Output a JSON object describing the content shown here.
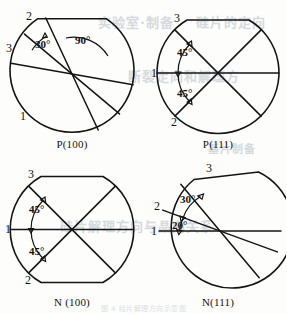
{
  "figure": {
    "stroke_color": "#141414",
    "background_color": "#fdfdfc",
    "ghost_color": "#cfd4d8"
  },
  "panels": [
    {
      "id": "p100",
      "caption": "P(100)",
      "flat": "top",
      "index_labels": [
        {
          "text": "2",
          "x": 22,
          "y": 16
        },
        {
          "text": "3",
          "x": 4,
          "y": 48
        },
        {
          "text": "1",
          "x": 18,
          "y": 115
        }
      ],
      "angle_labels": [
        {
          "text": "30°",
          "x": 33,
          "y": 43
        },
        {
          "text": "90°",
          "x": 74,
          "y": 40
        }
      ],
      "lines": [
        {
          "name": "line-1",
          "a1": 170,
          "a2": 350
        },
        {
          "name": "line-2",
          "a1": 140,
          "a2": 320
        },
        {
          "name": "line-3",
          "a1": 115,
          "a2": 295
        }
      ]
    },
    {
      "id": "p111",
      "caption": "P(111)",
      "flat": "top",
      "index_labels": [
        {
          "text": "3",
          "x": 25,
          "y": 18
        },
        {
          "text": "1",
          "x": 3,
          "y": 69
        },
        {
          "text": "2",
          "x": 22,
          "y": 120
        }
      ],
      "angle_labels": [
        {
          "text": "45°",
          "x": 30,
          "y": 48
        },
        {
          "text": "45°",
          "x": 30,
          "y": 90
        }
      ],
      "lines": [
        {
          "name": "line-1",
          "a1": 180,
          "a2": 0
        },
        {
          "name": "line-2",
          "a1": 225,
          "a2": 45
        },
        {
          "name": "line-3",
          "a1": 135,
          "a2": 315
        }
      ]
    },
    {
      "id": "n100",
      "caption": "N (100)",
      "flat": "top-bottom",
      "index_labels": [
        {
          "text": "3",
          "x": 25,
          "y": 18
        },
        {
          "text": "1",
          "x": 3,
          "y": 69
        },
        {
          "text": "2",
          "x": 22,
          "y": 120
        }
      ],
      "angle_labels": [
        {
          "text": "45°",
          "x": 28,
          "y": 48
        },
        {
          "text": "45°",
          "x": 28,
          "y": 92
        }
      ],
      "lines": [
        {
          "name": "line-1",
          "a1": 180,
          "a2": 0
        },
        {
          "name": "line-2",
          "a1": 225,
          "a2": 45
        },
        {
          "name": "line-3",
          "a1": 135,
          "a2": 315
        }
      ]
    },
    {
      "id": "n111",
      "caption": "N(111)",
      "flat": "top",
      "index_labels": [
        {
          "text": "3",
          "x": 58,
          "y": 10
        },
        {
          "text": "2",
          "x": 6,
          "y": 48
        },
        {
          "text": "1",
          "x": 3,
          "y": 73
        }
      ],
      "angle_labels": [
        {
          "text": "30°",
          "x": 32,
          "y": 40
        },
        {
          "text": "20°",
          "x": 24,
          "y": 66
        }
      ],
      "lines": [
        {
          "name": "line-1",
          "a1": 180,
          "a2": 0
        },
        {
          "name": "line-2",
          "a1": 160,
          "a2": 340
        },
        {
          "name": "line-3",
          "a1": 130,
          "a2": 310
        }
      ]
    }
  ],
  "ghost_text": [
    {
      "text": "实验室·制备",
      "x": 98,
      "y": 20,
      "size": 13
    },
    {
      "text": "硅片的定向",
      "x": 196,
      "y": 20,
      "size": 13
    },
    {
      "text": "断裂定向和解理方",
      "x": 128,
      "y": 74,
      "size": 13
    },
    {
      "text": "基片制备",
      "x": 208,
      "y": 148,
      "size": 11
    },
    {
      "text": "硅片解理方向与晶向关系",
      "x": 60,
      "y": 224,
      "size": 13
    }
  ],
  "footnote": {
    "text": "图 4 硅片解理方向示意图",
    "y": 305
  }
}
